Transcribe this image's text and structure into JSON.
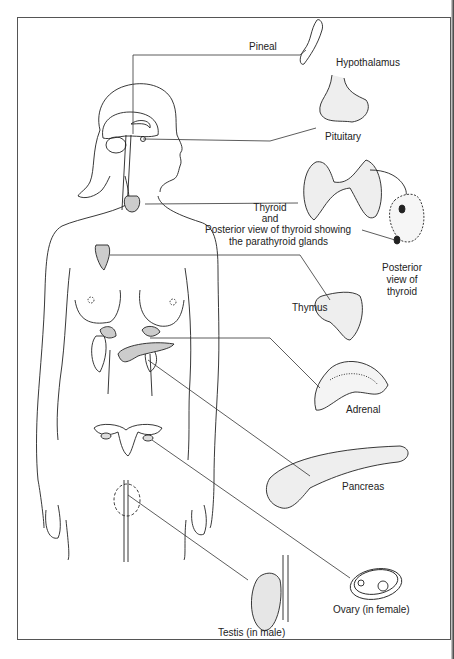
{
  "figure": {
    "labels": {
      "pineal": "Pineal",
      "hypothalamus": "Hypothalamus",
      "pituitary": "Pituitary",
      "thyroid_line1": "Thyroid",
      "thyroid_line2": "and",
      "thyroid_line3": "Posterior view of thyroid showing",
      "thyroid_line4": "the parathyroid glands",
      "posterior_line1": "Posterior",
      "posterior_line2": "view of",
      "posterior_line3": "thyroid",
      "thymus": "Thymus",
      "adrenal": "Adrenal",
      "pancreas": "Pancreas",
      "ovary": "Ovary  (in female)",
      "testis": "Testis  (in male)"
    }
  }
}
